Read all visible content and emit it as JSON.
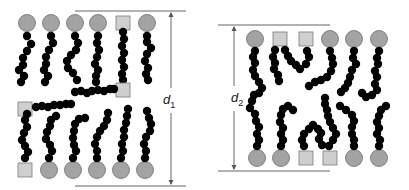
{
  "colors": {
    "head_circle_fill": "#a3a3a3",
    "head_circle_stroke": "#6f6f6f",
    "head_square_fill": "#cfcfcf",
    "head_square_stroke": "#7a7a7a",
    "tail_bead": "#000000",
    "dimension_line": "#555555"
  },
  "panels": [
    {
      "id": "left-bilayer",
      "dimension_label": "d",
      "dimension_subscript": "1",
      "top_leaflet_heads": [
        "circle",
        "circle",
        "circle",
        "circle",
        "square",
        "circle"
      ],
      "bottom_leaflet_heads": [
        "square",
        "circle",
        "circle",
        "circle",
        "circle",
        "circle"
      ],
      "extra_heads": [
        "square (interior, top-leaflet extended tail)",
        "square (interior, bottom-leaflet extended tail)"
      ]
    },
    {
      "id": "right-bilayer",
      "dimension_label": "d",
      "dimension_subscript": "2",
      "top_leaflet_heads": [
        "circle",
        "square",
        "square",
        "circle",
        "circle",
        "circle"
      ],
      "bottom_leaflet_heads": [
        "circle",
        "circle",
        "square",
        "square",
        "circle",
        "circle"
      ]
    }
  ]
}
